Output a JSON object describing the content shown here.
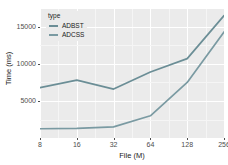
{
  "chart_data": {
    "type": "line",
    "title": "",
    "xlabel": "File (M)",
    "ylabel": "Time (ms)",
    "x": [
      8,
      16,
      32,
      64,
      128,
      256
    ],
    "categories": [
      "8",
      "16",
      "32",
      "64",
      "128",
      "256"
    ],
    "xtick_labels": [
      "8",
      "16",
      "32",
      "64",
      "128",
      "256"
    ],
    "ytick_labels": [
      "5000",
      "10000",
      "15000"
    ],
    "ytick_values": [
      5000,
      10000,
      15000
    ],
    "ylim": [
      0,
      17400
    ],
    "xlim_index": [
      0,
      5
    ],
    "grid": true,
    "panel_background": "#ebebeb",
    "grid_major_color": "#ffffff",
    "grid_minor_color": "#f5f5f5",
    "legend": {
      "title": "type",
      "position": "top-left-inside",
      "entries": [
        "ADBST",
        "ADCSS"
      ]
    },
    "series": [
      {
        "name": "ADBST",
        "color": "#6b8e96",
        "values": [
          6800,
          7800,
          6600,
          8900,
          10700,
          16500
        ]
      },
      {
        "name": "ADCSS",
        "color": "#7a9aa2",
        "values": [
          1250,
          1300,
          1500,
          3000,
          7500,
          14300
        ]
      }
    ]
  }
}
